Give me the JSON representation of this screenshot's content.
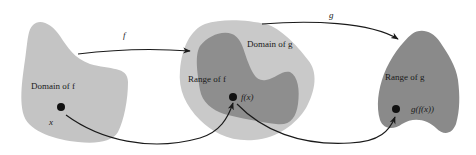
{
  "diagram": {
    "type": "function-composition",
    "colors": {
      "domain_f": "#c4c4c4",
      "domain_g": "#c9c9c9",
      "range_f": "#8e8e8e",
      "range_g": "#8a8a8a",
      "points": "#111111",
      "arrows": "#1a1a1a"
    },
    "labels": {
      "domain_f": "Domain of f",
      "domain_g": "Domain of g",
      "range_f": "Range of f",
      "range_g": "Range of g",
      "point_x": "x",
      "point_fx": "f(x)",
      "point_gfx": "g(f(x))",
      "arrow_f": "f",
      "arrow_g": "g"
    }
  }
}
